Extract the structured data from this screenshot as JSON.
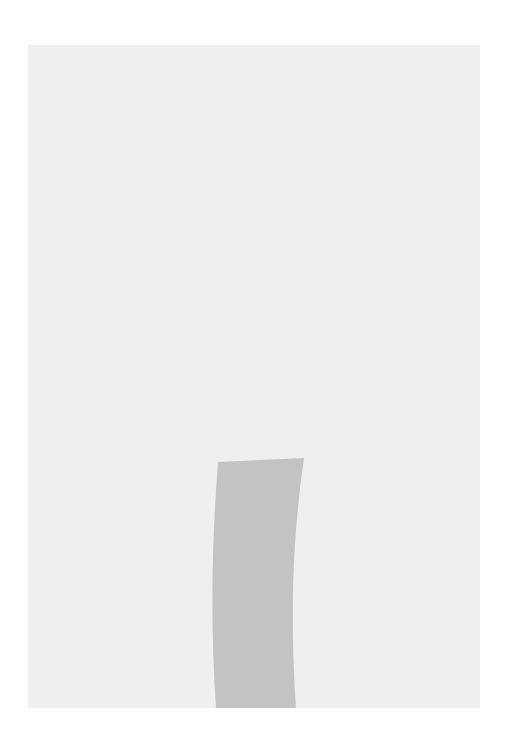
{
  "diagram": {
    "colors": {
      "background": "#ffffff",
      "panel": "#efefef",
      "shadow_path": "#c3c3c3",
      "domino_face": "#ffffff",
      "outline": "#1a1a1a",
      "pip": "#111111"
    },
    "top_row": {
      "caption": "Standing dominoes (complete sequence)",
      "dominoes": [
        {
          "label": "Fault of Person",
          "pips": 1,
          "x": 30
        },
        {
          "label": "Unsafe Practices",
          "pips": 2,
          "x": 121
        },
        {
          "label": "Unsafe Condition",
          "pips": 3,
          "x": 215
        },
        {
          "label": "Accident",
          "pips": 4,
          "x": 306
        },
        {
          "label": "Loss",
          "pips": 5,
          "x": 400
        }
      ]
    },
    "bottom_row": {
      "caption": "Sequence with unsafe condition removed",
      "dominoes": [
        {
          "label": "Fault of Person",
          "pips": 1,
          "x": 31
        },
        {
          "label": "Unsafe Practices",
          "pips": 2,
          "x": 122
        },
        {
          "label": "Accident",
          "pips": 4,
          "x": 306
        },
        {
          "label": "Loss",
          "pips": 5,
          "x": 401
        }
      ]
    },
    "removed_domino": {
      "label": "Unsafe Condition",
      "pips": 3
    }
  }
}
